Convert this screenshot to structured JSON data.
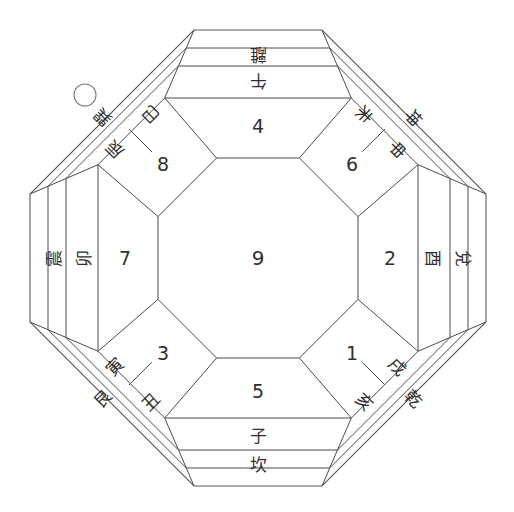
{
  "diagram": {
    "center": {
      "label": "9"
    },
    "marker": {
      "name": "circle-marker",
      "shape": "circle"
    },
    "rings": {
      "inner_numbers": [
        {
          "id": "n-top",
          "label": "4",
          "position": "top"
        },
        {
          "id": "n-top-right",
          "label": "6",
          "position": "top-right"
        },
        {
          "id": "n-right",
          "label": "2",
          "position": "right"
        },
        {
          "id": "n-bottom-right",
          "label": "1",
          "position": "bottom-right"
        },
        {
          "id": "n-bottom",
          "label": "5",
          "position": "bottom"
        },
        {
          "id": "n-bottom-left",
          "label": "3",
          "position": "bottom-left"
        },
        {
          "id": "n-left",
          "label": "7",
          "position": "left"
        },
        {
          "id": "n-top-left",
          "label": "8",
          "position": "top-left"
        }
      ],
      "branches": [
        {
          "id": "b-top",
          "label": "午",
          "position": "top"
        },
        {
          "id": "b-tr-outer",
          "label": "未",
          "position": "top-right-outer"
        },
        {
          "id": "b-tr-inner",
          "label": "申",
          "position": "top-right-inner"
        },
        {
          "id": "b-right",
          "label": "酉",
          "position": "right"
        },
        {
          "id": "b-br-outer",
          "label": "戌",
          "position": "bottom-right-outer"
        },
        {
          "id": "b-br-inner",
          "label": "亥",
          "position": "bottom-right-inner"
        },
        {
          "id": "b-bottom",
          "label": "子",
          "position": "bottom"
        },
        {
          "id": "b-bl-outer",
          "label": "丑",
          "position": "bottom-left-outer"
        },
        {
          "id": "b-bl-inner",
          "label": "寅",
          "position": "bottom-left-inner"
        },
        {
          "id": "b-left",
          "label": "卯",
          "position": "left"
        },
        {
          "id": "b-tl-outer",
          "label": "辰",
          "position": "top-left-outer"
        },
        {
          "id": "b-tl-inner",
          "label": "巳",
          "position": "top-left-inner"
        }
      ],
      "trigrams": [
        {
          "id": "t-top",
          "label": "離",
          "position": "top"
        },
        {
          "id": "t-top-right",
          "label": "坤",
          "position": "top-right"
        },
        {
          "id": "t-right",
          "label": "兌",
          "position": "right"
        },
        {
          "id": "t-bottom-right",
          "label": "乾",
          "position": "bottom-right"
        },
        {
          "id": "t-bottom",
          "label": "坎",
          "position": "bottom"
        },
        {
          "id": "t-bottom-left",
          "label": "艮",
          "position": "bottom-left"
        },
        {
          "id": "t-left",
          "label": "震",
          "position": "left"
        },
        {
          "id": "t-top-left",
          "label": "巽",
          "position": "top-left"
        }
      ]
    },
    "colors": {
      "line": "#4a4a4a",
      "text": "#2f2f2f",
      "background": "#ffffff"
    }
  }
}
